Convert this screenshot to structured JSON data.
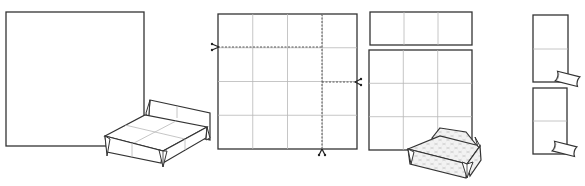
{
  "diagram": {
    "description": "Origami bed folding instructions: four steps showing a square sheet, a 4x4 grid with cut lines, the cut pieces, and the resulting pillows",
    "colors": {
      "outline": "#333333",
      "grid": "#b8b8b8",
      "cut_line": "#555555",
      "pattern_fill": "#d6d6d6",
      "pattern_light": "#f2f2f2",
      "background": "#ffffff"
    },
    "steps": [
      {
        "id": "step-1",
        "label": "Square sheet with finished bed",
        "elements": [
          "square-sheet",
          "finished-bed-illustration"
        ]
      },
      {
        "id": "step-2",
        "label": "4x4 creased grid with cut lines",
        "grid": {
          "rows": 4,
          "cols": 4
        },
        "cut_lines": 3,
        "icons": [
          "scissors-icon",
          "scissors-icon",
          "scissors-icon"
        ]
      },
      {
        "id": "step-3",
        "label": "Cut pieces: 1x3 strip and 3x3 square, with patterned mattress/box",
        "pieces": [
          {
            "name": "strip",
            "rows": 1,
            "cols": 3
          },
          {
            "name": "square",
            "rows": 3,
            "cols": 3
          }
        ]
      },
      {
        "id": "step-4",
        "label": "Two 2x1 pieces folded into pillows",
        "pieces": [
          {
            "name": "pillow-piece-1",
            "rows": 2,
            "cols": 1
          },
          {
            "name": "pillow-piece-2",
            "rows": 2,
            "cols": 1
          }
        ]
      }
    ]
  }
}
